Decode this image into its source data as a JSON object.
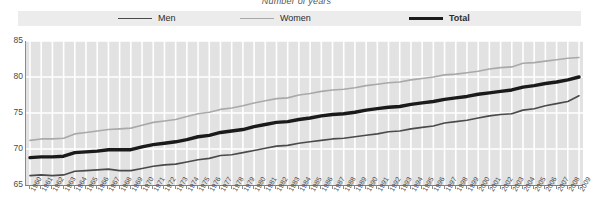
{
  "chart_data": {
    "type": "line",
    "title": "Number of years",
    "xlabel": "",
    "ylabel": "",
    "ylim": [
      65,
      85
    ],
    "yticks": [
      65,
      70,
      75,
      80,
      85
    ],
    "grid": "white horizontal and vertical gridlines on light gray panel",
    "legend_position": "top",
    "x": [
      1960,
      1961,
      1962,
      1963,
      1964,
      1965,
      1966,
      1967,
      1968,
      1969,
      1970,
      1971,
      1972,
      1973,
      1974,
      1975,
      1976,
      1977,
      1978,
      1979,
      1980,
      1981,
      1982,
      1983,
      1984,
      1985,
      1986,
      1987,
      1988,
      1989,
      1990,
      1991,
      1992,
      1993,
      1994,
      1995,
      1996,
      1997,
      1998,
      1999,
      2000,
      2001,
      2002,
      2003,
      2004,
      2005,
      2006,
      2007,
      2008,
      2009
    ],
    "categories": [
      "1960",
      "1961",
      "1962",
      "1963",
      "1964",
      "1965",
      "1966",
      "1967",
      "1968",
      "1969",
      "1970",
      "1971",
      "1972",
      "1973",
      "1974",
      "1975",
      "1976",
      "1977",
      "1978",
      "1979",
      "1980",
      "1981",
      "1982",
      "1983",
      "1984",
      "1985",
      "1986",
      "1987",
      "1988",
      "1989",
      "1990",
      "1991",
      "1992",
      "1993",
      "1994",
      "1995",
      "1996",
      "1997",
      "1998",
      "1999",
      "2000",
      "2001",
      "2002",
      "2003",
      "2004",
      "2005",
      "2006",
      "2007",
      "2008",
      "2009"
    ],
    "series": [
      {
        "name": "Men",
        "color": "#4a4a4a",
        "width": 1.6,
        "values": [
          66.3,
          66.4,
          66.3,
          66.4,
          66.9,
          67.0,
          67.1,
          67.2,
          67.0,
          67.0,
          67.3,
          67.6,
          67.8,
          67.9,
          68.2,
          68.5,
          68.7,
          69.1,
          69.2,
          69.5,
          69.8,
          70.1,
          70.4,
          70.5,
          70.8,
          71.0,
          71.2,
          71.4,
          71.5,
          71.7,
          71.9,
          72.1,
          72.4,
          72.5,
          72.8,
          73.0,
          73.2,
          73.6,
          73.8,
          74.0,
          74.3,
          74.6,
          74.8,
          74.9,
          75.4,
          75.6,
          76.0,
          76.3,
          76.6,
          77.4
        ]
      },
      {
        "name": "Women",
        "color": "#a9a9a9",
        "width": 1.6,
        "values": [
          71.2,
          71.4,
          71.4,
          71.5,
          72.1,
          72.3,
          72.5,
          72.7,
          72.8,
          72.9,
          73.3,
          73.7,
          73.9,
          74.1,
          74.5,
          74.9,
          75.1,
          75.5,
          75.7,
          76.0,
          76.4,
          76.7,
          77.0,
          77.1,
          77.5,
          77.7,
          78.0,
          78.2,
          78.3,
          78.5,
          78.8,
          79.0,
          79.2,
          79.3,
          79.6,
          79.8,
          80.0,
          80.3,
          80.4,
          80.6,
          80.8,
          81.1,
          81.3,
          81.4,
          81.9,
          82.0,
          82.2,
          82.4,
          82.6,
          82.7
        ]
      },
      {
        "name": "Total",
        "color": "#1a1a1a",
        "width": 3.4,
        "values": [
          68.8,
          68.9,
          68.9,
          69.0,
          69.5,
          69.6,
          69.7,
          69.9,
          69.9,
          69.9,
          70.3,
          70.6,
          70.8,
          71.0,
          71.3,
          71.7,
          71.9,
          72.3,
          72.5,
          72.7,
          73.1,
          73.4,
          73.7,
          73.8,
          74.1,
          74.3,
          74.6,
          74.8,
          74.9,
          75.1,
          75.4,
          75.6,
          75.8,
          75.9,
          76.2,
          76.4,
          76.6,
          76.9,
          77.1,
          77.3,
          77.6,
          77.8,
          78.0,
          78.2,
          78.6,
          78.8,
          79.1,
          79.3,
          79.6,
          80.0
        ]
      }
    ]
  },
  "legend": {
    "items": [
      {
        "label": "Men",
        "key": "men",
        "color": "#4a4a4a"
      },
      {
        "label": "Women",
        "key": "women",
        "color": "#a9a9a9"
      },
      {
        "label": "Total",
        "key": "total",
        "color": "#1a1a1a"
      }
    ]
  },
  "axis": {
    "y_labels": [
      "85",
      "80",
      "75",
      "70",
      "65"
    ],
    "x_first": "1960",
    "x_last": "2009"
  },
  "colors": {
    "panel": "#e2e2e2",
    "gridline": "#ffffff",
    "legend_band": "#ececec",
    "axis": "#8b8b8b",
    "text": "#4a4a4a"
  }
}
